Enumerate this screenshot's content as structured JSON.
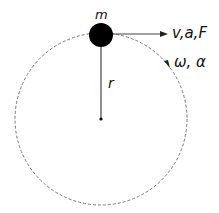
{
  "labels": {
    "mass": "m",
    "vector": "v,a,F",
    "angular": "ω, α",
    "radius": "r"
  },
  "geometry": {
    "center": [
      101,
      119
    ],
    "orbit_radius": 86,
    "mass_radius": 12
  },
  "colors": {
    "orbit": "#777777",
    "mass": "#000000",
    "line": "#555555"
  }
}
